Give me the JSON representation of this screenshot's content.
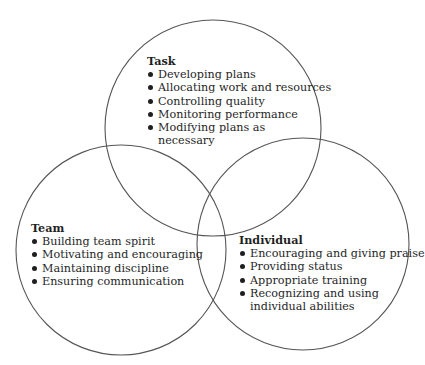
{
  "colors": {
    "circle_stroke": "#555555",
    "text": "#1f1f1f",
    "background": "#ffffff"
  },
  "circles": [
    {
      "name": "task",
      "cx": 213,
      "cy": 128,
      "r": 108
    },
    {
      "name": "team",
      "cx": 121,
      "cy": 250,
      "r": 105
    },
    {
      "name": "individual",
      "cx": 303,
      "cy": 244,
      "r": 106
    }
  ],
  "task": {
    "heading": "Task",
    "items": [
      {
        "line1": "Developing plans",
        "line2": ""
      },
      {
        "line1": "Allocating work and resources",
        "line2": ""
      },
      {
        "line1": "Controlling quality",
        "line2": ""
      },
      {
        "line1": "Monitoring performance",
        "line2": ""
      },
      {
        "line1": "Modifying plans as",
        "line2": "necessary"
      }
    ]
  },
  "team": {
    "heading": "Team",
    "items": [
      {
        "line1": "Building team spirit",
        "line2": ""
      },
      {
        "line1": "Motivating and encouraging",
        "line2": ""
      },
      {
        "line1": "Maintaining discipline",
        "line2": ""
      },
      {
        "line1": "Ensuring communication",
        "line2": ""
      }
    ]
  },
  "individual": {
    "heading": "Individual",
    "items": [
      {
        "line1": "Encouraging and giving praise",
        "line2": ""
      },
      {
        "line1": "Providing status",
        "line2": ""
      },
      {
        "line1": "Appropriate training",
        "line2": ""
      },
      {
        "line1": "Recognizing and using",
        "line2": "individual abilities"
      }
    ]
  }
}
